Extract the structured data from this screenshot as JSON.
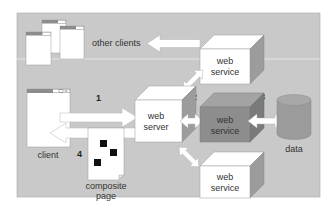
{
  "diagram": {
    "title": "",
    "colors": {
      "panel": "#c9c9c9",
      "separator": "#e4e4e4",
      "window_titlebar": "#8c8c8c",
      "cube_front": "#ffffff",
      "cube_top": "#ffffff",
      "cube_side": "#9a9a9a",
      "cube_highlight_front": "#8d8d8d",
      "cube_highlight_top": "#a3a3a3",
      "cube_highlight_side": "#7a7a7a",
      "cylinder": "#9b9b9b",
      "arrow_fill": "#ffffff",
      "arrow_stroke": "#b0b0b0",
      "ink": "#222222"
    },
    "nodes": {
      "other_clients": {
        "label": "other clients"
      },
      "client": {
        "label": "client"
      },
      "web_server": {
        "label_line1": "web",
        "label_line2": "server"
      },
      "web_service_top": {
        "label_line1": "web",
        "label_line2": "service"
      },
      "web_service_middle": {
        "label_line1": "web",
        "label_line2": "service"
      },
      "web_service_bottom": {
        "label_line1": "web",
        "label_line2": "service"
      },
      "data": {
        "label": "data"
      },
      "composite_page": {
        "label_line1": "composite",
        "label_line2": "page"
      }
    },
    "steps": {
      "step1": "1",
      "step2": "2",
      "step3": "3",
      "step4": "4"
    },
    "edges": [
      {
        "from": "web_service_top",
        "to": "other_clients",
        "direction": "one-way"
      },
      {
        "from": "client",
        "to": "web_server",
        "label": "1",
        "direction": "one-way"
      },
      {
        "from": "web_server",
        "to": "web_service_middle",
        "label": "2",
        "direction": "two-way"
      },
      {
        "from": "web_service_middle",
        "to": "data",
        "label": "3",
        "direction": "two-way"
      },
      {
        "from": "web_server",
        "to": "web_service_top",
        "direction": "two-way"
      },
      {
        "from": "web_server",
        "to": "web_service_bottom",
        "direction": "two-way"
      },
      {
        "from": "web_server",
        "to": "client",
        "label": "4",
        "direction": "one-way",
        "payload": "composite_page"
      }
    ]
  }
}
